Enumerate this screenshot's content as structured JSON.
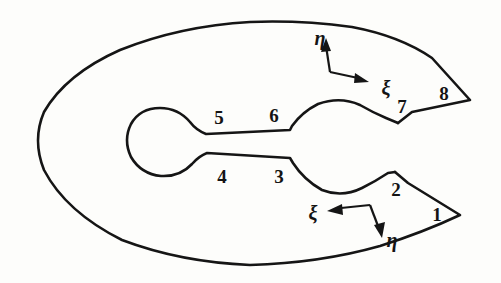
{
  "figure": {
    "background_color": "#fdfdfb",
    "stroke_color": "#151515"
  },
  "geometry": {
    "outer_boundary": {
      "shape": "ellipse-like closed curve opening into two wedge flanges on the right",
      "left_extent_px": 35,
      "top_extent_px": 22,
      "bottom_extent_px": 265,
      "right_tip_upper_px": [
        470,
        100
      ],
      "right_tip_lower_px": [
        460,
        215
      ]
    },
    "inner_cutout": {
      "shape": "dumbbell: small left circle, narrow slot, large right circle opening to the right",
      "left_circle_center_px": [
        166,
        143
      ],
      "left_circle_radius_px": 35,
      "right_circle_center_px": [
        345,
        148
      ],
      "right_circle_radius_px": 48
    }
  },
  "node_labels": [
    {
      "id": "node-1",
      "text": "1",
      "x": 437,
      "y": 214
    },
    {
      "id": "node-2",
      "text": "2",
      "x": 396,
      "y": 189
    },
    {
      "id": "node-3",
      "text": "3",
      "x": 279,
      "y": 176
    },
    {
      "id": "node-4",
      "text": "4",
      "x": 222,
      "y": 176
    },
    {
      "id": "node-5",
      "text": "5",
      "x": 219,
      "y": 117
    },
    {
      "id": "node-6",
      "text": "6",
      "x": 274,
      "y": 115
    },
    {
      "id": "node-7",
      "text": "7",
      "x": 402,
      "y": 106
    },
    {
      "id": "node-8",
      "text": "8",
      "x": 444,
      "y": 93
    }
  ],
  "coordinate_frames": [
    {
      "id": "upper-frame",
      "position": "upper-right",
      "corner_px": [
        330,
        72
      ],
      "eta": {
        "symbol": "η",
        "label_x": 320,
        "label_y": 38,
        "tip_px": [
          326,
          40
        ]
      },
      "xi": {
        "symbol": "ξ",
        "label_x": 386,
        "label_y": 88,
        "tip_px": [
          369,
          82
        ]
      }
    },
    {
      "id": "lower-frame",
      "position": "lower-right",
      "corner_px": [
        370,
        205
      ],
      "xi": {
        "symbol": "ξ",
        "label_x": 313,
        "label_y": 213,
        "tip_px": [
          327,
          211
        ]
      },
      "eta": {
        "symbol": "η",
        "label_x": 392,
        "label_y": 240,
        "tip_px": [
          382,
          236
        ]
      }
    }
  ]
}
